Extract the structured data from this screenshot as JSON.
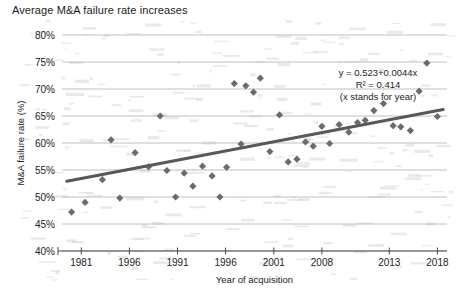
{
  "figure": {
    "title": "Average M&A failure rate increases"
  },
  "chart_data": {
    "type": "scatter",
    "title": "Average M&A failure rate increases",
    "xlabel": "Year of acquisition",
    "ylabel": "M&A failure rate (%)",
    "xlim": [
      1979,
      2019
    ],
    "ylim": [
      40,
      80
    ],
    "y_tick_labels": [
      "80%",
      "75%",
      "70%",
      "65%",
      "60%",
      "55%",
      "50%",
      "45%",
      "40%"
    ],
    "y_tick_values": [
      80,
      75,
      70,
      65,
      60,
      55,
      50,
      45,
      40
    ],
    "x_tick_labels": [
      "1981",
      "1996",
      "1991",
      "1996",
      "2001",
      "2008",
      "2013",
      "2018"
    ],
    "x_tick_values": [
      1981,
      1986,
      1991,
      1996,
      2001,
      2006,
      2013,
      2018
    ],
    "grid": "horizontal",
    "legend": "none",
    "marker_shape": "diamond",
    "marker_color": "#6b6b6b",
    "trendline_color": "#585858",
    "annotation": {
      "equation": "y = 0.523+0.0044x",
      "r_squared": "R² = 0.414",
      "note": "(x stands for year)"
    },
    "trendline": {
      "x_start": 1979.5,
      "y_start": 52.9,
      "x_end": 2018.6,
      "y_end": 66.2
    },
    "points": [
      {
        "x": 1980.0,
        "y": 47.2
      },
      {
        "x": 1981.4,
        "y": 49.0
      },
      {
        "x": 1983.2,
        "y": 53.2
      },
      {
        "x": 1984.1,
        "y": 60.6
      },
      {
        "x": 1985.0,
        "y": 49.8
      },
      {
        "x": 1986.6,
        "y": 58.2
      },
      {
        "x": 1988.0,
        "y": 55.6
      },
      {
        "x": 1989.2,
        "y": 65.0
      },
      {
        "x": 1989.9,
        "y": 54.9
      },
      {
        "x": 1990.8,
        "y": 50.0
      },
      {
        "x": 1991.7,
        "y": 54.4
      },
      {
        "x": 1992.6,
        "y": 52.0
      },
      {
        "x": 1993.6,
        "y": 55.7
      },
      {
        "x": 1994.6,
        "y": 53.9
      },
      {
        "x": 1995.4,
        "y": 50.0
      },
      {
        "x": 1996.1,
        "y": 55.5
      },
      {
        "x": 1996.9,
        "y": 71.0
      },
      {
        "x": 1997.6,
        "y": 59.8
      },
      {
        "x": 1998.1,
        "y": 70.6
      },
      {
        "x": 1998.9,
        "y": 69.4
      },
      {
        "x": 1999.6,
        "y": 72.0
      },
      {
        "x": 2000.6,
        "y": 58.4
      },
      {
        "x": 2001.6,
        "y": 65.2
      },
      {
        "x": 2002.5,
        "y": 56.5
      },
      {
        "x": 2003.4,
        "y": 57.0
      },
      {
        "x": 2004.3,
        "y": 60.2
      },
      {
        "x": 2005.1,
        "y": 59.4
      },
      {
        "x": 2006.0,
        "y": 63.1
      },
      {
        "x": 2006.8,
        "y": 59.9
      },
      {
        "x": 2007.8,
        "y": 63.4
      },
      {
        "x": 2008.8,
        "y": 62.0
      },
      {
        "x": 2009.7,
        "y": 63.8
      },
      {
        "x": 2010.5,
        "y": 64.2
      },
      {
        "x": 2011.4,
        "y": 66.0
      },
      {
        "x": 2012.4,
        "y": 67.3
      },
      {
        "x": 2013.4,
        "y": 63.2
      },
      {
        "x": 2014.2,
        "y": 63.0
      },
      {
        "x": 2015.2,
        "y": 62.3
      },
      {
        "x": 2016.1,
        "y": 69.6
      },
      {
        "x": 2016.9,
        "y": 74.8
      },
      {
        "x": 2018.0,
        "y": 64.9
      }
    ]
  }
}
